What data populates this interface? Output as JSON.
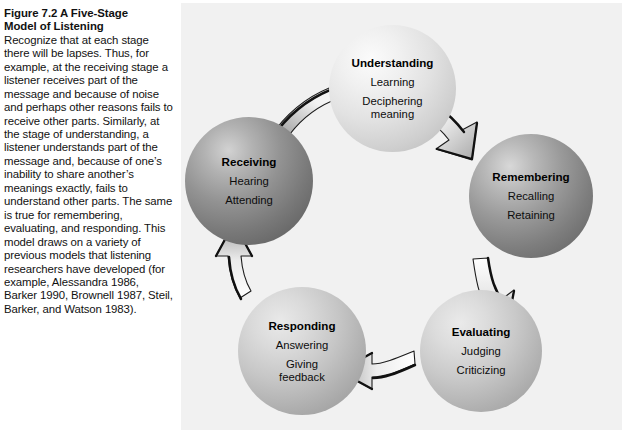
{
  "figure": {
    "title": "Figure 7.2  A Five-Stage Model of Listening",
    "title_line1": "Figure 7.2  A Five-Stage",
    "title_line2": "Model of Listening",
    "caption": "Recognize that at each stage there will be lapses. Thus, for example, at the receiving stage a listener receives part of the message and because of noise and perhaps other reasons fails to receive other parts. Similarly, at the stage of understanding, a listener understands part of the mes­sage and, because of one’s inability to share another’s meanings exactly, fails to understand other parts. The same is true for remember­ing, evaluating, and respond­ing. This model draws on a variety of previous models that listening researchers have developed (for example, Alessandra 1986, Barker 1990, Brownell 1987, Steil, Barker, and Watson 1983)."
  },
  "diagram": {
    "type": "cycle",
    "background_color": "#f1f1f1",
    "nodes": [
      {
        "id": "understanding",
        "title": "Understanding",
        "items": [
          "Learning",
          "Deciphering meaning"
        ],
        "shade": "light",
        "fill_color": "#e2e2e2"
      },
      {
        "id": "remembering",
        "title": "Remembering",
        "items": [
          "Recalling",
          "Retaining"
        ],
        "shade": "dark",
        "fill_color": "#8a8a8a"
      },
      {
        "id": "evaluating",
        "title": "Evaluating",
        "items": [
          "Judging",
          "Criticizing"
        ],
        "shade": "medium",
        "fill_color": "#c2c2c2"
      },
      {
        "id": "responding",
        "title": "Responding",
        "items": [
          "Answering",
          "Giving feedback"
        ],
        "shade": "medium",
        "fill_color": "#c0c0c0"
      },
      {
        "id": "receiving",
        "title": "Receiving",
        "items": [
          "Hearing",
          "Attending"
        ],
        "shade": "dark",
        "fill_color": "#858585"
      }
    ],
    "arrows": [
      {
        "id": "receiving-to-understanding",
        "from": "receiving",
        "to": "understanding",
        "direction": "up-right"
      },
      {
        "id": "understanding-to-remembering",
        "from": "understanding",
        "to": "remembering",
        "direction": "down-right"
      },
      {
        "id": "remembering-to-evaluating",
        "from": "remembering",
        "to": "evaluating",
        "direction": "down"
      },
      {
        "id": "evaluating-to-responding",
        "from": "evaluating",
        "to": "responding",
        "direction": "left"
      },
      {
        "id": "responding-to-receiving",
        "from": "responding",
        "to": "receiving",
        "direction": "up"
      }
    ]
  }
}
